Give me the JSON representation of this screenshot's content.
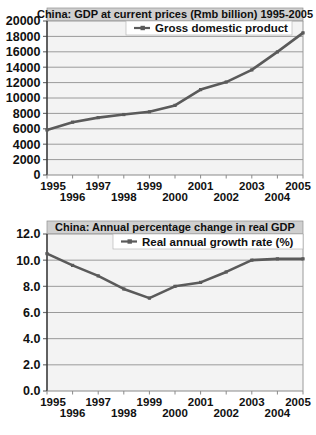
{
  "page": {
    "background": "#ffffff",
    "width": 316,
    "height": 435
  },
  "style": {
    "title_bar_fill": "#cfcfcf",
    "plot_fill": "#f3f3f3",
    "grid_color": "#9a9a9a",
    "axis_color": "#6f6f6f",
    "series_color": "#5a5a5a",
    "legend_fill": "#ffffff",
    "text_color": "#101010"
  },
  "charts": [
    {
      "id": "gdp-chart",
      "title": "China: GDP at current prices (Rmb billion) 1995-2005",
      "legend": {
        "label": "Gross domestic product",
        "marker": "line-with-dot-marker"
      },
      "chart_data": {
        "type": "line",
        "title": "China: GDP at current prices (Rmb billion) 1995-2005",
        "xlabel": "",
        "ylabel": "",
        "categories": [
          "1995",
          "1996",
          "1997",
          "1998",
          "1999",
          "2000",
          "2001",
          "2002",
          "2003",
          "2004",
          "2005"
        ],
        "x_tick_labels": [
          "1995",
          "1996",
          "1997",
          "1998",
          "1999",
          "2000",
          "2001",
          "2002",
          "2003",
          "2004",
          "2005"
        ],
        "y_tick_labels": [
          "0",
          "2000",
          "4000",
          "6000",
          "8000",
          "10000",
          "12000",
          "14000",
          "16000",
          "18000",
          "20000"
        ],
        "ylim": [
          0,
          20000
        ],
        "ytick_step": 2000,
        "grid": true,
        "legend_position": "top-center",
        "series": [
          {
            "name": "Gross domestic product",
            "values": [
              5850,
              6860,
              7450,
              7850,
              8210,
              9040,
              11090,
              12070,
              13650,
              15990,
              18460
            ]
          }
        ]
      }
    },
    {
      "id": "growth-chart",
      "title": "China: Annual percentage change in real GDP",
      "legend": {
        "label": "Real annual growth rate (%)",
        "marker": "line-with-dot-marker"
      },
      "chart_data": {
        "type": "line",
        "title": "China: Annual percentage change in real GDP",
        "xlabel": "",
        "ylabel": "",
        "categories": [
          "1995",
          "1996",
          "1997",
          "1998",
          "1999",
          "2000",
          "2001",
          "2002",
          "2003",
          "2004",
          "2005"
        ],
        "x_tick_labels": [
          "1995",
          "1996",
          "1997",
          "1998",
          "1999",
          "2000",
          "2001",
          "2002",
          "2003",
          "2004",
          "2005"
        ],
        "y_tick_labels": [
          "0.0",
          "2.0",
          "4.0",
          "6.0",
          "8.0",
          "10.0",
          "12.0"
        ],
        "ylim": [
          0.0,
          12.0
        ],
        "ytick_step": 2.0,
        "grid": true,
        "legend_position": "top-center",
        "series": [
          {
            "name": "Real annual growth rate (%)",
            "values": [
              10.5,
              9.6,
              8.8,
              7.8,
              7.1,
              8.0,
              8.3,
              9.1,
              10.0,
              10.1,
              10.1
            ]
          }
        ]
      }
    }
  ]
}
